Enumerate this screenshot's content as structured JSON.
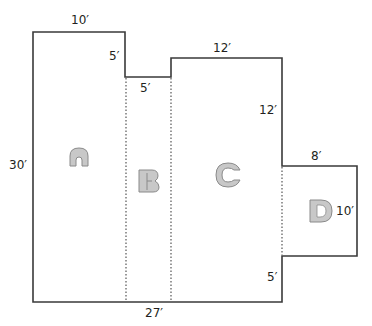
{
  "diagram": {
    "colors": {
      "outline": "#3a3a3a",
      "dotted": "#555555",
      "letter_fill": "#c8c8c8",
      "letter_stroke": "#8a8a8a",
      "text": "#231f20"
    },
    "dimensions": {
      "top_left_width": "10′",
      "notch_depth": "5′",
      "notch_width": "5′",
      "top_right_width": "12′",
      "right_upper_height": "12′",
      "wing_width": "8′",
      "wing_height": "10′",
      "right_lower_height": "5′",
      "left_height": "30′",
      "bottom_width": "27′"
    },
    "sections": [
      {
        "id": "A",
        "label": "A"
      },
      {
        "id": "B",
        "label": "B"
      },
      {
        "id": "C",
        "label": "C"
      },
      {
        "id": "D",
        "label": "D"
      }
    ]
  }
}
